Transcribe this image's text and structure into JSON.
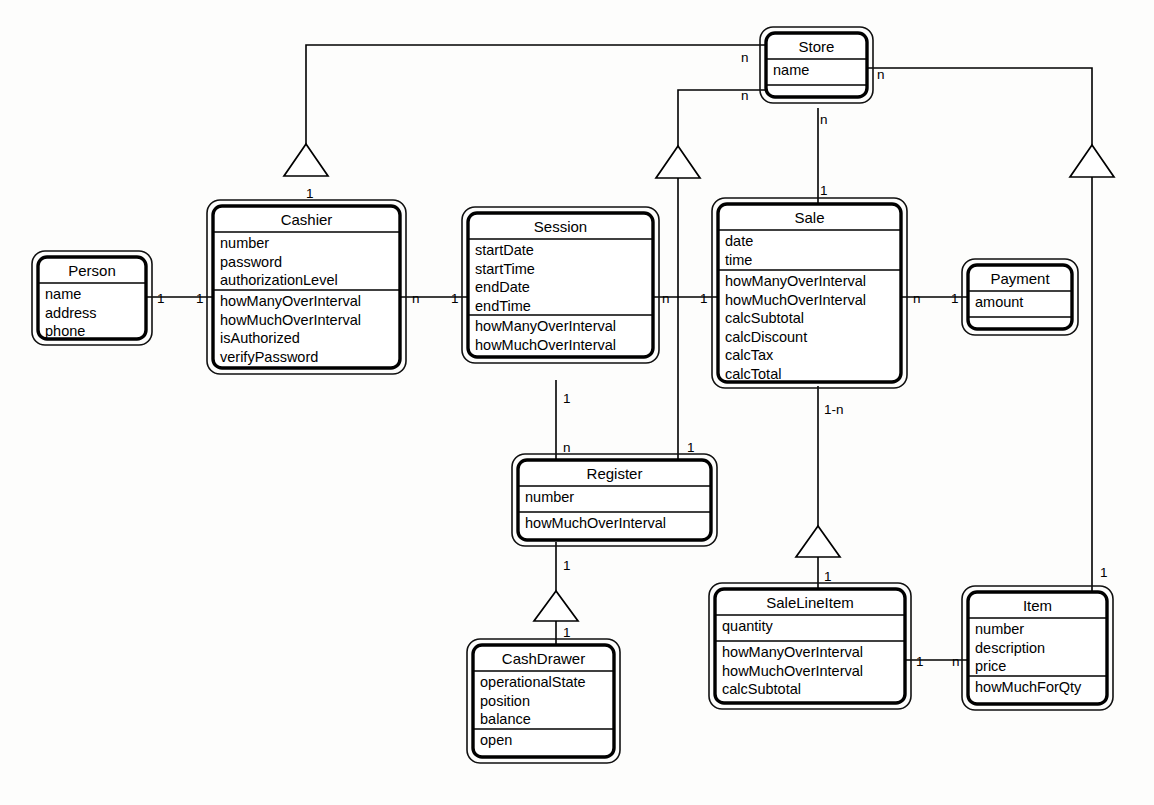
{
  "diagram": {
    "type": "uml-class-diagram",
    "background_color": "#fdfdfc",
    "line_color": "#000000"
  },
  "classes": [
    {
      "id": "person",
      "name": "Person",
      "attributes": [
        "name",
        "address",
        "phone"
      ],
      "operations": [],
      "has_empty_compartment": false,
      "x": 38,
      "y": 257,
      "w": 108,
      "title_h": 26,
      "attr_h": 56,
      "op_h": 12
    },
    {
      "id": "cashier",
      "name": "Cashier",
      "attributes": [
        "number",
        "password",
        "authorizationLevel"
      ],
      "operations": [
        "howManyOverInterval",
        "howMuchOverInterval",
        "isAuthorized",
        "verifyPassword"
      ],
      "has_empty_compartment": false,
      "x": 213,
      "y": 206,
      "w": 187,
      "title_h": 26,
      "attr_h": 58,
      "op_h": 78
    },
    {
      "id": "session",
      "name": "Session",
      "attributes": [
        "startDate",
        "startTime",
        "endDate",
        "endTime"
      ],
      "operations": [
        "howManyOverInterval",
        "howMuchOverInterval"
      ],
      "has_empty_compartment": false,
      "x": 468,
      "y": 213,
      "w": 185,
      "title_h": 26,
      "attr_h": 76,
      "op_h": 42
    },
    {
      "id": "sale",
      "name": "Sale",
      "attributes": [
        "date",
        "time"
      ],
      "operations": [
        "howManyOverInterval",
        "howMuchOverInterval",
        "calcSubtotal",
        "calcDiscount",
        "calcTax",
        "calcTotal"
      ],
      "has_empty_compartment": false,
      "x": 718,
      "y": 204,
      "w": 183,
      "title_h": 26,
      "attr_h": 40,
      "op_h": 112
    },
    {
      "id": "store",
      "name": "Store",
      "attributes": [
        "name"
      ],
      "operations": [],
      "has_empty_compartment": true,
      "x": 766,
      "y": 33,
      "w": 101,
      "title_h": 26,
      "attr_h": 26,
      "op_h": 12
    },
    {
      "id": "payment",
      "name": "Payment",
      "attributes": [
        "amount"
      ],
      "operations": [],
      "has_empty_compartment": true,
      "x": 968,
      "y": 265,
      "w": 104,
      "title_h": 26,
      "attr_h": 26,
      "op_h": 12
    },
    {
      "id": "register",
      "name": "Register",
      "attributes": [
        "number"
      ],
      "operations": [
        "howMuchOverInterval"
      ],
      "has_empty_compartment": false,
      "x": 518,
      "y": 460,
      "w": 193,
      "title_h": 26,
      "attr_h": 26,
      "op_h": 28
    },
    {
      "id": "cashdrawer",
      "name": "CashDrawer",
      "attributes": [
        "operationalState",
        "position",
        "balance"
      ],
      "operations": [
        "open"
      ],
      "has_empty_compartment": false,
      "x": 473,
      "y": 645,
      "w": 141,
      "title_h": 26,
      "attr_h": 58,
      "op_h": 28
    },
    {
      "id": "salelineitem",
      "name": "SaleLineItem",
      "attributes": [
        "quantity"
      ],
      "operations": [
        "howManyOverInterval",
        "howMuchOverInterval",
        "calcSubtotal"
      ],
      "has_empty_compartment": false,
      "x": 715,
      "y": 589,
      "w": 190,
      "title_h": 26,
      "attr_h": 26,
      "op_h": 62
    },
    {
      "id": "item",
      "name": "Item",
      "attributes": [
        "number",
        "description",
        "price"
      ],
      "operations": [
        "howMuchForQty"
      ],
      "has_empty_compartment": false,
      "x": 968,
      "y": 592,
      "w": 139,
      "title_h": 26,
      "attr_h": 58,
      "op_h": 28
    }
  ],
  "associations": [
    {
      "id": "person-cashier",
      "from": "Person",
      "to": "Cashier",
      "from_mult": "1",
      "to_mult": "1"
    },
    {
      "id": "cashier-session",
      "from": "Cashier",
      "to": "Session",
      "from_mult": "n",
      "to_mult": "1"
    },
    {
      "id": "session-sale",
      "from": "Session",
      "to": "Sale",
      "from_mult": "n",
      "to_mult": "1"
    },
    {
      "id": "sale-payment",
      "from": "Sale",
      "to": "Payment",
      "from_mult": "n",
      "to_mult": "1"
    },
    {
      "id": "session-register",
      "from": "Session",
      "to": "Register",
      "from_mult": "1",
      "to_mult": "n"
    },
    {
      "id": "sale-salelineitem",
      "from": "Sale",
      "to": "SaleLineItem",
      "from_mult": "1-n",
      "to_mult": "1"
    },
    {
      "id": "salelineitem-item",
      "from": "SaleLineItem",
      "to": "Item",
      "from_mult": "1",
      "to_mult": "n"
    },
    {
      "id": "register-cashdrawer",
      "from": "Register",
      "to": "CashDrawer",
      "from_mult": "1",
      "to_mult": "1"
    },
    {
      "id": "store-cashier",
      "from": "Store",
      "to": "Cashier",
      "from_mult": "n",
      "to_mult": "1"
    },
    {
      "id": "store-register",
      "from": "Store",
      "to": "Register",
      "from_mult": "n",
      "to_mult": "1"
    },
    {
      "id": "store-sale",
      "from": "Store",
      "to": "Sale",
      "from_mult": "n",
      "to_mult": "1"
    },
    {
      "id": "store-item",
      "from": "Store",
      "to": "Item",
      "from_mult": "n",
      "to_mult": "1"
    }
  ],
  "multiplicity_labels": [
    {
      "id": "m-person-right",
      "text": "1",
      "x": 157,
      "y": 303
    },
    {
      "id": "m-cashier-left",
      "text": "1",
      "x": 196,
      "y": 303
    },
    {
      "id": "m-cashier-right",
      "text": "n",
      "x": 412,
      "y": 303
    },
    {
      "id": "m-session-left",
      "text": "1",
      "x": 451,
      "y": 303
    },
    {
      "id": "m-session-right",
      "text": "n",
      "x": 662,
      "y": 303
    },
    {
      "id": "m-sale-left",
      "text": "1",
      "x": 700,
      "y": 303
    },
    {
      "id": "m-sale-right",
      "text": "n",
      "x": 913,
      "y": 303
    },
    {
      "id": "m-payment-left",
      "text": "1",
      "x": 951,
      "y": 303
    },
    {
      "id": "m-cashier-top",
      "text": "1",
      "x": 306,
      "y": 198
    },
    {
      "id": "m-store-left-upper",
      "text": "n",
      "x": 741,
      "y": 62
    },
    {
      "id": "m-store-left-lower",
      "text": "n",
      "x": 741,
      "y": 100
    },
    {
      "id": "m-store-right",
      "text": "n",
      "x": 877,
      "y": 79
    },
    {
      "id": "m-store-bottom",
      "text": "n",
      "x": 820,
      "y": 124
    },
    {
      "id": "m-sale-top",
      "text": "1",
      "x": 820,
      "y": 195
    },
    {
      "id": "m-session-bottom",
      "text": "1",
      "x": 563,
      "y": 403
    },
    {
      "id": "m-register-top-left",
      "text": "n",
      "x": 563,
      "y": 452
    },
    {
      "id": "m-register-top-right",
      "text": "1",
      "x": 687,
      "y": 452
    },
    {
      "id": "m-register-bottom",
      "text": "1",
      "x": 563,
      "y": 570
    },
    {
      "id": "m-cashdrawer-top",
      "text": "1",
      "x": 563,
      "y": 637
    },
    {
      "id": "m-sale-bottom",
      "text": "1-n",
      "x": 824,
      "y": 414
    },
    {
      "id": "m-salelineitem-top",
      "text": "1",
      "x": 824,
      "y": 581
    },
    {
      "id": "m-salelineitem-right",
      "text": "1",
      "x": 916,
      "y": 666
    },
    {
      "id": "m-item-left",
      "text": "n",
      "x": 952,
      "y": 666
    },
    {
      "id": "m-item-top",
      "text": "1",
      "x": 1100,
      "y": 577
    }
  ]
}
